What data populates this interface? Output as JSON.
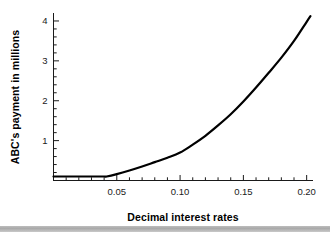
{
  "chart_data": {
    "type": "line",
    "title": "",
    "xlabel": "Decimal interest rates",
    "ylabel": "ABC's payment in millions",
    "xlim": [
      0.0,
      0.205
    ],
    "ylim": [
      0.0,
      4.2
    ],
    "xticks": [
      0.05,
      0.1,
      0.15,
      0.2
    ],
    "xtick_labels": [
      "0.05",
      "0.10",
      "0.15",
      "0.20"
    ],
    "xminor_step": 0.01,
    "yticks": [
      1,
      2,
      3,
      4
    ],
    "ytick_labels": [
      "1",
      "2",
      "3",
      "4"
    ],
    "yminor_step": 0.2,
    "grid": false,
    "legend": null,
    "line_color": "#000000",
    "line_width": 2.2,
    "series": [
      {
        "name": "ABC's payment",
        "x": [
          0.0,
          0.005,
          0.01,
          0.015,
          0.02,
          0.025,
          0.03,
          0.035,
          0.04,
          0.042,
          0.05,
          0.06,
          0.07,
          0.08,
          0.09,
          0.1,
          0.11,
          0.12,
          0.13,
          0.14,
          0.15,
          0.16,
          0.17,
          0.18,
          0.19,
          0.2,
          0.203
        ],
        "y": [
          0.1,
          0.1,
          0.1,
          0.1,
          0.1,
          0.1,
          0.1,
          0.1,
          0.1,
          0.1,
          0.16,
          0.25,
          0.35,
          0.46,
          0.57,
          0.7,
          0.9,
          1.12,
          1.38,
          1.66,
          1.98,
          2.33,
          2.7,
          3.08,
          3.5,
          3.98,
          4.12
        ]
      }
    ]
  },
  "axes": {
    "x_title": "Decimal interest rates",
    "y_title": "ABC's payment in millions"
  }
}
